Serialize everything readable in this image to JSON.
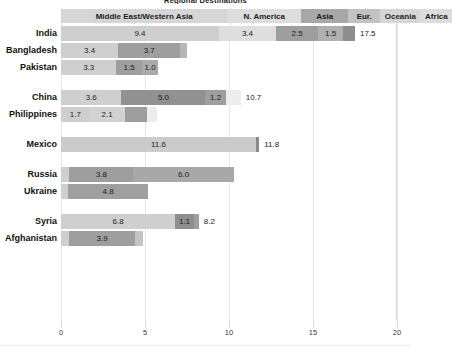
{
  "chart_data": {
    "type": "bar",
    "orientation": "horizontal",
    "stacked": true,
    "title": "Regional Destinations",
    "xlabel": "",
    "ylabel": "",
    "xlim": [
      0,
      20
    ],
    "xticks": [
      0,
      5,
      10,
      15,
      20
    ],
    "xtick_labels": [
      "0",
      "5",
      "10",
      "15",
      "20"
    ],
    "grid": true,
    "legend_position": "top",
    "series": [
      {
        "name": "Middle East/Western Asia",
        "color": "#cfcfcf"
      },
      {
        "name": "N. America",
        "color": "#d9d9d9"
      },
      {
        "name": "Asia",
        "color": "#9a9a9a"
      },
      {
        "name": "Eur.",
        "color": "#b4b4b4"
      },
      {
        "name": "Oceania",
        "color": "#9a9a9a"
      },
      {
        "name": "Africa",
        "color": "#8f8f8f"
      }
    ],
    "categories": [
      "India",
      "Bangladesh",
      "Pakistan",
      "China",
      "Philippines",
      "Mexico",
      "Russia",
      "Ukraine",
      "Syria",
      "Afghanistan"
    ],
    "groups": [
      {
        "rows": [
          "India",
          "Bangladesh",
          "Pakistan"
        ]
      },
      {
        "rows": [
          "China",
          "Philippines"
        ]
      },
      {
        "rows": [
          "Mexico"
        ]
      },
      {
        "rows": [
          "Russia",
          "Ukraine"
        ]
      },
      {
        "rows": [
          "Syria",
          "Afghanistan"
        ]
      }
    ],
    "rows": [
      {
        "label": "India",
        "total": "17.5",
        "segments": [
          {
            "series": "Middle East/Western Asia",
            "value": 9.4,
            "label": "9.4",
            "color": "#cfcfcf"
          },
          {
            "series": "N. America",
            "value": 3.4,
            "label": "3.4",
            "color": "#dedede"
          },
          {
            "series": "Asia",
            "value": 2.5,
            "label": "2.5",
            "color": "#9e9e9e"
          },
          {
            "series": "Eur.",
            "value": 1.5,
            "label": "1.5",
            "color": "#b0b0b0"
          },
          {
            "series": "Oceania",
            "value": 0.7,
            "label": "",
            "color": "#8e8e8e"
          }
        ]
      },
      {
        "label": "Bangladesh",
        "total": "",
        "segments": [
          {
            "series": "Middle East/Western Asia",
            "value": 3.4,
            "label": "3.4",
            "color": "#cfcfcf"
          },
          {
            "series": "Asia",
            "value": 3.7,
            "label": "3.7",
            "color": "#9e9e9e"
          },
          {
            "series": "Africa",
            "value": 0.4,
            "label": "",
            "color": "#b6b6b6"
          }
        ]
      },
      {
        "label": "Pakistan",
        "total": "",
        "segments": [
          {
            "series": "Middle East/Western Asia",
            "value": 3.3,
            "label": "3.3",
            "color": "#cfcfcf"
          },
          {
            "series": "Asia",
            "value": 1.5,
            "label": "1.5",
            "color": "#9e9e9e"
          },
          {
            "series": "Eur.",
            "value": 1.0,
            "label": "1.0",
            "color": "#aaaaaa"
          }
        ]
      },
      {
        "label": "China",
        "total": "10.7",
        "segments": [
          {
            "series": "Middle East/Western Asia",
            "value": 3.6,
            "label": "3.6",
            "color": "#cfcfcf"
          },
          {
            "series": "Asia",
            "value": 5.0,
            "label": "5.0",
            "color": "#919191"
          },
          {
            "series": "Eur.",
            "value": 1.2,
            "label": "1.2",
            "color": "#9e9e9e"
          },
          {
            "series": "Oceania",
            "value": 0.9,
            "label": "",
            "color": "#ededed"
          }
        ]
      },
      {
        "label": "Philippines",
        "total": "",
        "segments": [
          {
            "series": "Middle East/Western Asia",
            "value": 1.7,
            "label": "1.7",
            "color": "#cfcfcf"
          },
          {
            "series": "N. America",
            "value": 2.1,
            "label": "2.1",
            "color": "#d2d2d2"
          },
          {
            "series": "Asia",
            "value": 1.3,
            "label": "",
            "color": "#9e9e9e"
          },
          {
            "series": "Oceania",
            "value": 0.6,
            "label": "",
            "color": "#ededed"
          }
        ]
      },
      {
        "label": "Mexico",
        "total": "11.8",
        "segments": [
          {
            "series": "N. America",
            "value": 11.6,
            "label": "11.6",
            "color": "#cbcbcb"
          },
          {
            "series": "Asia",
            "value": 0.2,
            "label": "",
            "color": "#8a8a8a"
          }
        ]
      },
      {
        "label": "Russia",
        "total": "",
        "segments": [
          {
            "series": "Middle East/Western Asia",
            "value": 0.5,
            "label": "",
            "color": "#cfcfcf"
          },
          {
            "series": "Asia",
            "value": 3.8,
            "label": "3.8",
            "color": "#9e9e9e"
          },
          {
            "series": "Eur.",
            "value": 6.0,
            "label": "6.0",
            "color": "#a8a8a8"
          }
        ]
      },
      {
        "label": "Ukraine",
        "total": "",
        "segments": [
          {
            "series": "Middle East/Western Asia",
            "value": 0.4,
            "label": "",
            "color": "#cfcfcf"
          },
          {
            "series": "Eur.",
            "value": 4.8,
            "label": "4.8",
            "color": "#a0a0a0"
          }
        ]
      },
      {
        "label": "Syria",
        "total": "8.2",
        "segments": [
          {
            "series": "Middle East/Western Asia",
            "value": 6.8,
            "label": "6.8",
            "color": "#cfcfcf"
          },
          {
            "series": "Asia",
            "value": 1.1,
            "label": "1.1",
            "color": "#8e8e8e"
          },
          {
            "series": "Eur.",
            "value": 0.3,
            "label": "",
            "color": "#9e9e9e"
          }
        ]
      },
      {
        "label": "Afghanistan",
        "total": "",
        "segments": [
          {
            "series": "Middle East/Western Asia",
            "value": 0.5,
            "label": "",
            "color": "#cfcfcf"
          },
          {
            "series": "Asia",
            "value": 3.9,
            "label": "3.9",
            "color": "#9e9e9e"
          },
          {
            "series": "Eur.",
            "value": 0.5,
            "label": "",
            "color": "#c4c4c4"
          }
        ]
      }
    ],
    "legend_cells": [
      {
        "label": "Middle East/Western Asia",
        "start": 0.0,
        "end": 9.9,
        "color": "#d6d6d6"
      },
      {
        "label": "N. America",
        "start": 9.9,
        "end": 14.3,
        "color": "#dddddd"
      },
      {
        "label": "Asia",
        "start": 14.3,
        "end": 17.1,
        "color": "#a8a8a8"
      },
      {
        "label": "Eur.",
        "start": 17.1,
        "end": 19.0,
        "color": "#c2c2c2"
      },
      {
        "label": "Oceania",
        "start": 19.0,
        "end": 21.4,
        "color": "#d6d6d6"
      },
      {
        "label": "Africa",
        "start": 21.4,
        "end": 23.3,
        "color": "#dddddd"
      }
    ]
  }
}
